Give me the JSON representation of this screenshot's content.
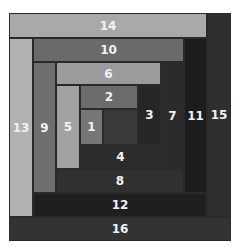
{
  "diagram": {
    "title": "",
    "type": "log-cabin-block",
    "strips": [
      {
        "label": "14",
        "x": 9,
        "y": 13,
        "w": 198,
        "h": 25,
        "color": "#a9a9a9"
      },
      {
        "label": "13",
        "x": 9,
        "y": 38,
        "w": 24,
        "h": 179,
        "color": "#b1b1b1"
      },
      {
        "label": "10",
        "x": 33,
        "y": 38,
        "w": 151,
        "h": 24,
        "color": "#6a6a6a"
      },
      {
        "label": "9",
        "x": 33,
        "y": 62,
        "w": 23,
        "h": 131,
        "color": "#6f6f6f"
      },
      {
        "label": "6",
        "x": 56,
        "y": 62,
        "w": 105,
        "h": 23,
        "color": "#9b9b9b"
      },
      {
        "label": "5",
        "x": 56,
        "y": 85,
        "w": 24,
        "h": 84,
        "color": "#a2a2a2"
      },
      {
        "label": "2",
        "x": 80,
        "y": 85,
        "w": 58,
        "h": 24,
        "color": "#6c6c6c"
      },
      {
        "label": "1",
        "x": 80,
        "y": 109,
        "w": 23,
        "h": 36,
        "color": "#767676"
      },
      {
        "label": "",
        "x": 103,
        "y": 109,
        "w": 35,
        "h": 36,
        "color": "#3b3b3b"
      },
      {
        "label": "3",
        "x": 138,
        "y": 85,
        "w": 23,
        "h": 60,
        "color": "#262626"
      },
      {
        "label": "4",
        "x": 80,
        "y": 145,
        "w": 81,
        "h": 24,
        "color": "#2c2c2c"
      },
      {
        "label": "7",
        "x": 161,
        "y": 62,
        "w": 23,
        "h": 107,
        "color": "#2b2b2b"
      },
      {
        "label": "8",
        "x": 56,
        "y": 169,
        "w": 128,
        "h": 24,
        "color": "#303030"
      },
      {
        "label": "11",
        "x": 184,
        "y": 38,
        "w": 23,
        "h": 155,
        "color": "#1c1c1c"
      },
      {
        "label": "12",
        "x": 33,
        "y": 193,
        "w": 174,
        "h": 24,
        "color": "#1f1f1f"
      },
      {
        "label": "15",
        "x": 207,
        "y": 13,
        "w": 24,
        "h": 204,
        "color": "#2f2f2f"
      },
      {
        "label": "16",
        "x": 9,
        "y": 217,
        "w": 222,
        "h": 24,
        "color": "#333333"
      }
    ]
  }
}
